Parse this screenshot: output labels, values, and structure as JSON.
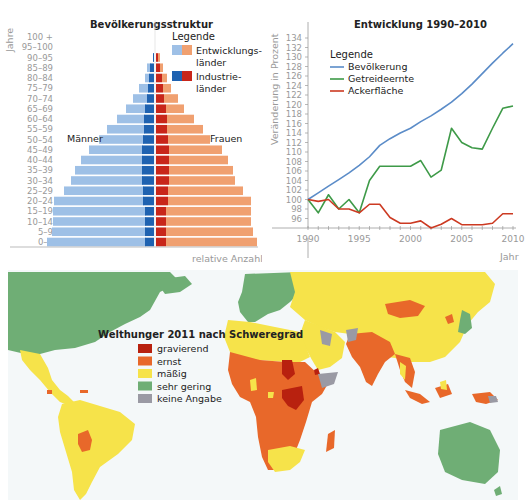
{
  "pyramid": {
    "title": "Bevölkerungsstruktur",
    "yaxis_label": "Jahre",
    "xaxis_label": "relative Anzahl",
    "left_label": "Männer",
    "right_label": "Frauen",
    "legend": {
      "title": "Legende",
      "items": [
        {
          "label_line1": "Entwicklungs-",
          "label_line2": "länder",
          "color_left": "#9ec0e6",
          "color_right": "#f0a070"
        },
        {
          "label_line1": "Industrie-",
          "label_line2": "länder",
          "color_left": "#1f62b0",
          "color_right": "#c8261a"
        }
      ]
    }
  },
  "linechart": {
    "title": "Entwicklung 1990–2010",
    "ylabel": "Veränderung in Prozent",
    "xlabel": "Jahr",
    "legend_title": "Legende"
  },
  "map": {
    "title": "Welthunger 2011 nach Schweregrad",
    "legend": [
      {
        "label": "gravierend",
        "color": "#b8210f"
      },
      {
        "label": "ernst",
        "color": "#e8682a"
      },
      {
        "label": "mäßig",
        "color": "#f6e34a"
      },
      {
        "label": "sehr gering",
        "color": "#6fae75"
      },
      {
        "label": "keine Angabe",
        "color": "#9a9aa4"
      }
    ],
    "ocean_color": "#f4f8f9"
  },
  "chart_data": [
    {
      "type": "bar",
      "subtype": "population-pyramid",
      "title": "Bevölkerungsstruktur",
      "ylabel": "Jahre",
      "xlabel": "relative Anzahl",
      "categories": [
        "0–4",
        "5–9",
        "10–14",
        "15–19",
        "20–24",
        "25–29",
        "30–34",
        "35–39",
        "40–44",
        "45–49",
        "50–54",
        "55–59",
        "60–64",
        "65–69",
        "70–74",
        "75–79",
        "80–84",
        "85–89",
        "90–95",
        "95–100",
        "100 +"
      ],
      "series": [
        {
          "name": "Männer Entwicklungsländer",
          "values": [
            99,
            94,
            93,
            93,
            90,
            80,
            72,
            68,
            62,
            54,
            45,
            38,
            28,
            20,
            15,
            10,
            5,
            4,
            1,
            0,
            0
          ]
        },
        {
          "name": "Männer Industrieländer",
          "values": [
            9,
            9,
            9,
            9,
            11,
            11,
            12,
            12,
            12,
            12,
            11,
            10,
            10,
            9,
            7,
            6,
            5,
            4,
            1,
            0,
            0
          ]
        },
        {
          "name": "Frauen Industrieländer",
          "values": [
            10,
            10,
            10,
            10,
            12,
            12,
            13,
            13,
            13,
            13,
            12,
            11,
            11,
            10,
            8,
            7,
            6,
            4,
            2,
            0,
            0
          ]
        },
        {
          "name": "Frauen Entwicklungsländer",
          "values": [
            91,
            87,
            85,
            85,
            83,
            75,
            66,
            64,
            59,
            53,
            42,
            36,
            27,
            18,
            14,
            8,
            5,
            3,
            2,
            0,
            0
          ]
        }
      ],
      "legend": [
        "Entwicklungsländer",
        "Industrieländer"
      ],
      "annotations": [
        "Männer",
        "Frauen"
      ]
    },
    {
      "type": "line",
      "title": "Entwicklung 1990–2010",
      "xlabel": "Jahr",
      "ylabel": "Veränderung in Prozent",
      "x": [
        1990,
        1991,
        1992,
        1993,
        1994,
        1995,
        1996,
        1997,
        1998,
        1999,
        2000,
        2001,
        2002,
        2003,
        2004,
        2005,
        2006,
        2007,
        2008,
        2009,
        2010
      ],
      "series": [
        {
          "name": "Bevölkerung",
          "color": "#5b8cc8",
          "values": [
            100,
            101.4,
            102.8,
            104.2,
            105.6,
            107.2,
            109,
            111.4,
            112.8,
            114,
            115,
            116.4,
            117.6,
            119,
            120.5,
            122.3,
            124.3,
            126.5,
            128.7,
            130.8,
            132.8
          ]
        },
        {
          "name": "Getreideernte",
          "color": "#3e9a48",
          "values": [
            100,
            97.2,
            101,
            98,
            100,
            97.2,
            104,
            107,
            107,
            107,
            107,
            108.2,
            104.7,
            106.2,
            115,
            112,
            110.9,
            110.6,
            115,
            119.2,
            119.7
          ]
        },
        {
          "name": "Ackerfläche",
          "color": "#cc3a22",
          "values": [
            100,
            99.6,
            100,
            98,
            98,
            97.2,
            99,
            99,
            96.2,
            95,
            95,
            95.5,
            94,
            94.8,
            96,
            94.7,
            94.7,
            94.7,
            95,
            97,
            97
          ]
        }
      ],
      "xticks": [
        1990,
        1995,
        2000,
        2005,
        2010
      ],
      "yticks": [
        96,
        98,
        100,
        102,
        104,
        106,
        108,
        110,
        112,
        114,
        116,
        118,
        120,
        122,
        124,
        126,
        128,
        130,
        132,
        134
      ],
      "ylim": [
        94,
        135
      ],
      "xlim": [
        1990,
        2010
      ],
      "legend_title": "Legende",
      "legend_position": "upper-left",
      "grid": false
    }
  ]
}
